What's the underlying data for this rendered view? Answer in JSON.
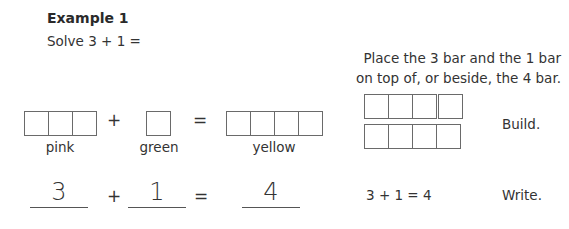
{
  "example": {
    "title": "Example 1",
    "prompt": "Solve 3 + 1 ="
  },
  "instruction": {
    "line1": "Place the 3 bar and the 1 bar",
    "line2": "on top of, or beside, the 4 bar."
  },
  "build_row": {
    "plus": "+",
    "equals": "=",
    "bars": [
      {
        "label": "pink",
        "cells": 3
      },
      {
        "label": "green",
        "cells": 1
      },
      {
        "label": "yellow",
        "cells": 4
      }
    ],
    "step_label": "Build."
  },
  "write_row": {
    "answers": [
      "3",
      "1",
      "4"
    ],
    "plus": "+",
    "equals": "=",
    "sentence": "3 + 1 = 4",
    "step_label": "Write."
  }
}
